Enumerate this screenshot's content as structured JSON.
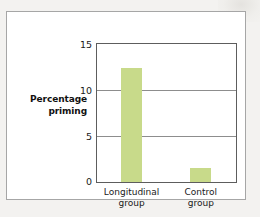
{
  "figure": {
    "panel_border_color": "#a6a6a6",
    "page_background": "#f3f2f0"
  },
  "chart_data": {
    "type": "bar",
    "title": "",
    "xlabel": "",
    "ylabel": "Percentage priming",
    "ylabel_lines": [
      "Percentage",
      "priming"
    ],
    "categories": [
      "Longitudinal group",
      "Control group"
    ],
    "category_lines": [
      [
        "Longitudinal",
        "group"
      ],
      [
        "Control",
        "group"
      ]
    ],
    "values": [
      12.5,
      1.5
    ],
    "ylim": [
      0,
      15
    ],
    "yticks": [
      0,
      5,
      10,
      15
    ],
    "ytick_labels": [
      "0",
      "5",
      "10",
      "15"
    ],
    "grid": true,
    "legend": "none",
    "bar_color": "#c8da8a",
    "axis_color": "#5d5d5d",
    "gridline_color": "#8d8d8d"
  }
}
